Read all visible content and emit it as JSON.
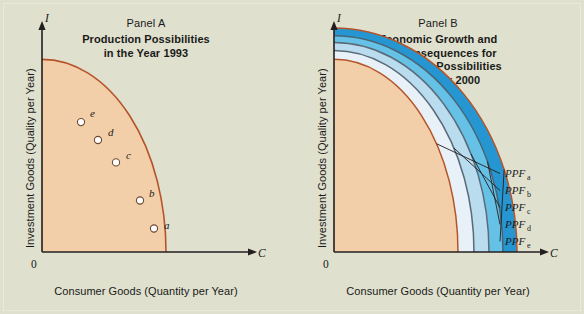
{
  "figure": {
    "background_color": "#dfe0cd",
    "axis_color": "#231f20",
    "curve_color": "#b5542a"
  },
  "chart_data": {
    "type": "line",
    "xlabel": "Consumer Goods (Quantity per Year)",
    "ylabel": "Investment Goods (Quality per Year)",
    "xvar": "C",
    "yvar": "I",
    "origin": "0",
    "grid": false,
    "panels": [
      {
        "id": "panel-a",
        "name": "Panel A",
        "subtitle_lines": [
          "Production Possibilities",
          "in the Year 1993"
        ],
        "curves": [
          {
            "name": "PPF 1993",
            "fill_color": "#f3cfa9",
            "stroke_color": "#b5542a",
            "y_intercept": 0.86,
            "x_intercept": 0.62
          }
        ],
        "points": [
          {
            "label": "a",
            "x": 0.56,
            "y": 0.105
          },
          {
            "label": "b",
            "x": 0.49,
            "y": 0.23
          },
          {
            "label": "c",
            "x": 0.37,
            "y": 0.4
          },
          {
            "label": "d",
            "x": 0.28,
            "y": 0.5
          },
          {
            "label": "e",
            "x": 0.195,
            "y": 0.58
          }
        ]
      },
      {
        "id": "panel-b",
        "name": "Panel B",
        "subtitle_lines": [
          "Economic Growth and",
          "the Consequences for",
          "Production Possibilities",
          "in the Year 2000"
        ],
        "curves": [
          {
            "name": "PPFa",
            "label": "PPF",
            "subscript": "a",
            "fill_color": "#f3cfa9",
            "stroke_color": "#b5542a",
            "y_intercept": 0.86,
            "x_intercept": 0.62
          },
          {
            "name": "PPFb",
            "label": "PPF",
            "subscript": "b",
            "fill_color": "#e8f1f7",
            "stroke_color": "#5b6a78",
            "y_intercept": 0.9,
            "x_intercept": 0.7
          },
          {
            "name": "PPFc",
            "label": "PPF",
            "subscript": "c",
            "fill_color": "#b9dcef",
            "stroke_color": "#5b6a78",
            "y_intercept": 0.935,
            "x_intercept": 0.775
          },
          {
            "name": "PPFd",
            "label": "PPF",
            "subscript": "d",
            "fill_color": "#66c1e6",
            "stroke_color": "#4a6575",
            "y_intercept": 0.965,
            "x_intercept": 0.845
          },
          {
            "name": "PPFe",
            "label": "PPF",
            "subscript": "e",
            "fill_color": "#2596d1",
            "stroke_color": "#b5542a",
            "y_intercept": 1.0,
            "x_intercept": 0.915
          }
        ],
        "leader_lines": true
      }
    ]
  }
}
